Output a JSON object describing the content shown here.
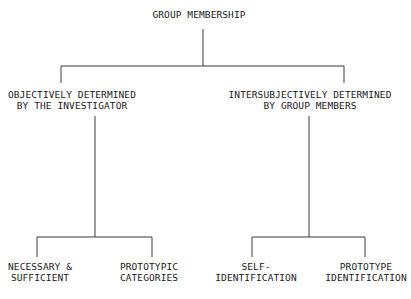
{
  "diagram": {
    "type": "tree",
    "line_color": "#3a3a3a",
    "root": {
      "lines": [
        "GROUP MEMBERSHIP"
      ]
    },
    "level1": [
      {
        "lines": [
          "OBJECTIVELY DETERMINED",
          "BY THE INVESTIGATOR"
        ]
      },
      {
        "lines": [
          "INTERSUBJECTIVELY DETERMINED",
          "BY GROUP MEMBERS"
        ]
      }
    ],
    "level2": [
      {
        "lines": [
          "NECESSARY &",
          "SUFFICIENT"
        ]
      },
      {
        "lines": [
          "PROTOTYPIC",
          "CATEGORIES"
        ]
      },
      {
        "lines": [
          "SELF-",
          "IDENTIFICATION"
        ]
      },
      {
        "lines": [
          "PROTOTYPE",
          "IDENTIFICATION"
        ]
      }
    ]
  }
}
